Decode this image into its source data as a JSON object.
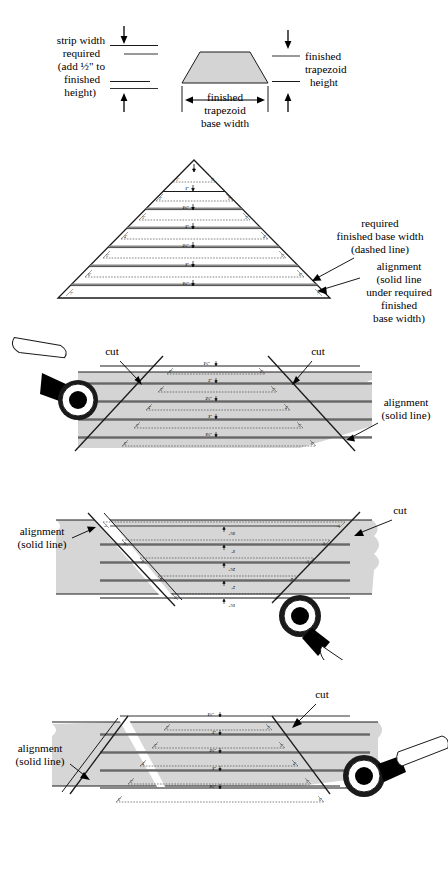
{
  "document": {
    "title": "Cutting trapezoid strips diagram",
    "type": "quilting instructional diagram",
    "figure_count": 5,
    "colors": {
      "fabric_gray": "#d4d4d4",
      "line_dark": "#1a1a1a",
      "line_mid": "#555555",
      "background": "#ffffff"
    }
  },
  "figure1": {
    "name": "strip-width-trapezoid-reference",
    "left_label": "strip width\nrequired\n(add ½\" to\nfinished\nheight)",
    "left_label_lines": [
      "strip width",
      "required",
      "(add ½\" to",
      "finished",
      "height)"
    ],
    "right_label_lines": [
      "finished",
      "trapezoid",
      "height"
    ],
    "base_label_lines": [
      "finished",
      "trapezoid",
      "base width"
    ]
  },
  "figure2": {
    "name": "triangle-strip-layout",
    "annotation_required_lines": [
      "required",
      "finished base width",
      "(dashed line)"
    ],
    "annotation_alignment_lines": [
      "alignment",
      "(solid line",
      "under required",
      "finished",
      "base width)"
    ],
    "center_measurements": [
      "1\"",
      "1½\"",
      "2\"",
      "2½\"",
      "3\"",
      "3½\""
    ],
    "side_measurements": [
      "1\"",
      "2\"",
      "3\"",
      "4\"",
      "5\"",
      "6\"",
      "7\""
    ]
  },
  "figure3": {
    "name": "fabric-strip-first-cut",
    "cut_label_left": "cut",
    "cut_label_right": "cut",
    "alignment_lines": [
      "alignment",
      "(solid line)"
    ],
    "center_measurements": [
      "1½\"",
      "2\"",
      "2½\"",
      "3\"",
      "3½\""
    ],
    "side_measurements": [
      "2\"",
      "3\"",
      "4\"",
      "5\"",
      "6\"",
      "7\""
    ],
    "tool": "rotary-cutter"
  },
  "figure4": {
    "name": "fabric-strip-flipped-cut",
    "cut_label_right": "cut",
    "alignment_lines": [
      "alignment",
      "(solid line)"
    ],
    "center_measurements": [
      "3½\"",
      "3\"",
      "2½\"",
      "2\"",
      "1½\""
    ],
    "side_measurements": [
      "7\"",
      "6\"",
      "5\"",
      "4\"",
      "3\"",
      "2\""
    ],
    "tool": "rotary-cutter",
    "orientation": "rotated-180"
  },
  "figure5": {
    "name": "fabric-strip-final-cut",
    "cut_label_right": "cut",
    "alignment_lines": [
      "alignment",
      "(solid line)"
    ],
    "center_measurements": [
      "1½\"",
      "2\"",
      "2½\"",
      "3\"",
      "3½\""
    ],
    "side_measurements": [
      "2\"",
      "3\"",
      "4\"",
      "5\"",
      "6\"",
      "7\""
    ],
    "tool": "rotary-cutter"
  }
}
